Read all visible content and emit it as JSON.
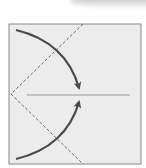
{
  "diagram": {
    "type": "origami-fold-step",
    "paper": {
      "x": 9,
      "y": 24,
      "width": 132,
      "height": 140,
      "fill": "#ececec",
      "stroke": "#888888"
    },
    "colors": {
      "arrow": "#4a4a4a",
      "dashed": "#666666",
      "center_line": "#999999"
    },
    "center_line": {
      "x1": 27,
      "y1": 95,
      "x2": 130,
      "y2": 95
    },
    "valley_folds": [
      {
        "x1": 83,
        "y1": 24,
        "x2": 11,
        "y2": 94
      },
      {
        "x1": 11,
        "y1": 94,
        "x2": 83,
        "y2": 164
      }
    ],
    "arrows": [
      {
        "name": "top-flap-arrow",
        "from": [
          16,
          30
        ],
        "to": [
          80,
          90
        ]
      },
      {
        "name": "bottom-flap-arrow",
        "from": [
          16,
          159
        ],
        "to": [
          80,
          100
        ]
      }
    ]
  }
}
